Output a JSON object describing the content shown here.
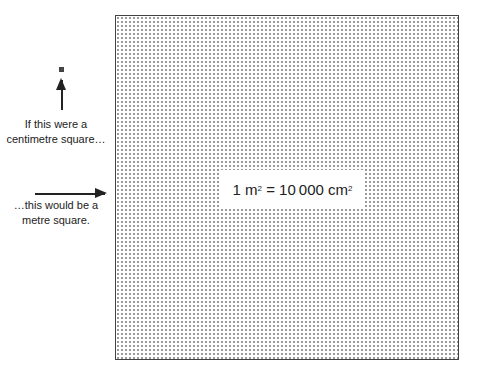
{
  "diagram": {
    "small_square_caption_line1": "If this were a",
    "small_square_caption_line2": "centimetre square…",
    "large_square_caption_line1": "…this would be a",
    "large_square_caption_line2": "metre square.",
    "equation": {
      "lhs_number": "1",
      "lhs_unit": "m",
      "lhs_exponent": "2",
      "equals": "=",
      "rhs_number": "10 000",
      "rhs_unit": "cm",
      "rhs_exponent": "2"
    }
  }
}
